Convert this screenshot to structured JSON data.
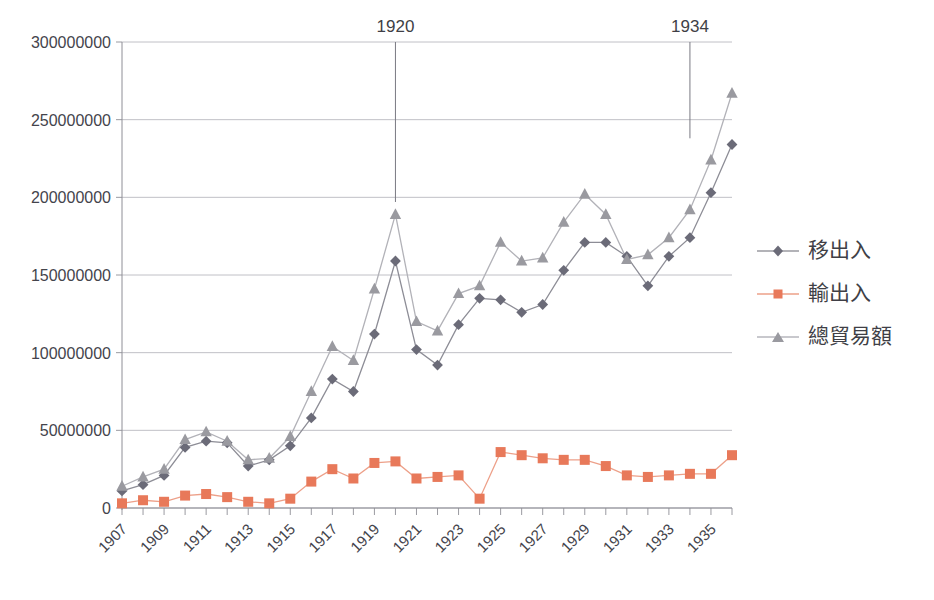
{
  "chart_data": {
    "type": "line",
    "title": "",
    "xlabel": "",
    "ylabel": "",
    "grid": true,
    "legend_position": "right",
    "xlim": [
      1907,
      1936
    ],
    "ylim": [
      0,
      300000000
    ],
    "yticks": [
      0,
      50000000,
      100000000,
      150000000,
      200000000,
      250000000,
      300000000
    ],
    "ytick_labels": [
      "0",
      "50000000",
      "100000000",
      "150000000",
      "200000000",
      "250000000",
      "300000000"
    ],
    "x": [
      1907,
      1908,
      1909,
      1910,
      1911,
      1912,
      1913,
      1914,
      1915,
      1916,
      1917,
      1918,
      1919,
      1920,
      1921,
      1922,
      1923,
      1924,
      1925,
      1926,
      1927,
      1928,
      1929,
      1930,
      1931,
      1932,
      1933,
      1934,
      1935,
      1936
    ],
    "xtick_labels": [
      "1907",
      "1909",
      "1911",
      "1913",
      "1915",
      "1917",
      "1919",
      "1921",
      "1923",
      "1925",
      "1927",
      "1929",
      "1931",
      "1933",
      "1935"
    ],
    "xtick_values": [
      1907,
      1909,
      1911,
      1913,
      1915,
      1917,
      1919,
      1921,
      1923,
      1925,
      1927,
      1929,
      1931,
      1933,
      1935
    ],
    "series": [
      {
        "name": "移出入",
        "marker": "diamond",
        "color": "#6b6b78",
        "values": [
          11000000,
          15000000,
          21000000,
          39000000,
          43000000,
          42000000,
          27000000,
          31000000,
          40000000,
          58000000,
          83000000,
          75000000,
          112000000,
          159000000,
          102000000,
          92000000,
          118000000,
          135000000,
          134000000,
          126000000,
          131000000,
          153000000,
          171000000,
          171000000,
          162000000,
          143000000,
          162000000,
          174000000,
          203000000,
          234000000
        ]
      },
      {
        "name": "輸出入",
        "marker": "square",
        "color": "#e8795a",
        "values": [
          3000000,
          5000000,
          4000000,
          8000000,
          9000000,
          7000000,
          4000000,
          3000000,
          6000000,
          17000000,
          25000000,
          19000000,
          29000000,
          30000000,
          19000000,
          20000000,
          21000000,
          6000000,
          36000000,
          34000000,
          32000000,
          31000000,
          31000000,
          27000000,
          21000000,
          20000000,
          21000000,
          22000000,
          22000000,
          34000000
        ]
      },
      {
        "name": "總貿易額",
        "marker": "triangle",
        "color": "#9a9aa0",
        "values": [
          14000000,
          20000000,
          25000000,
          44000000,
          49000000,
          43000000,
          31000000,
          32000000,
          46000000,
          75000000,
          104000000,
          95000000,
          141000000,
          189000000,
          120000000,
          114000000,
          138000000,
          143000000,
          171000000,
          159000000,
          161000000,
          184000000,
          202000000,
          189000000,
          160000000,
          163000000,
          174000000,
          192000000,
          224000000,
          267000000
        ]
      }
    ],
    "annotations": [
      {
        "label": "1920",
        "x": 1920,
        "y_top": 300000000,
        "y_bottom": 197000000
      },
      {
        "label": "1934",
        "x": 1934,
        "y_top": 305000000,
        "y_bottom": 238000000
      }
    ]
  }
}
